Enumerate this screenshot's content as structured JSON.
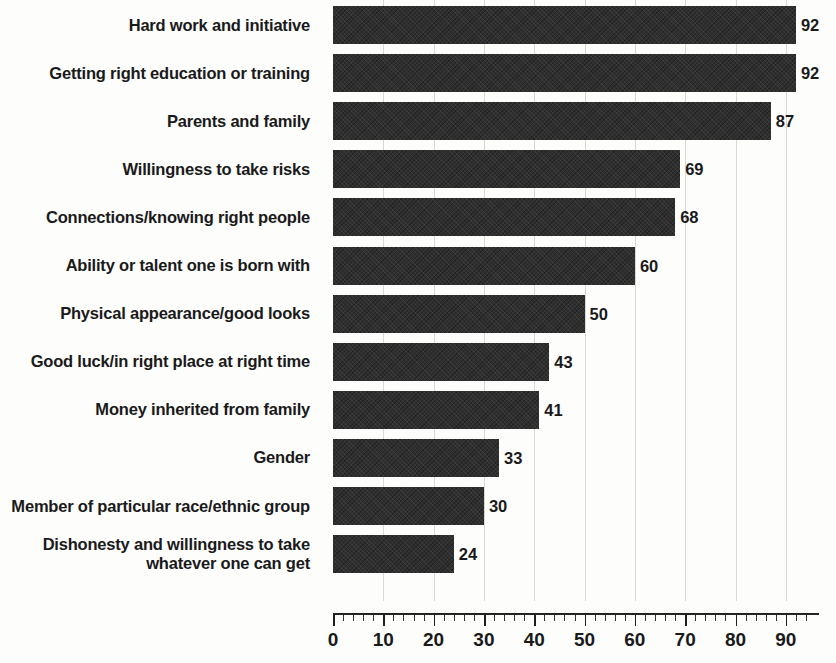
{
  "chart_data": {
    "type": "bar",
    "orientation": "horizontal",
    "title": "",
    "xlabel": "",
    "ylabel": "",
    "xlim": [
      0,
      96
    ],
    "grid": true,
    "legend": false,
    "bar_color": "#2f2f2f",
    "categories": [
      "Hard work and initiative",
      "Getting right education or training",
      "Parents and family",
      "Willingness to take risks",
      "Connections/knowing right people",
      "Ability or talent one is born with",
      "Physical appearance/good looks",
      "Good luck/in right place at right time",
      "Money inherited from family",
      "Gender",
      "Member of particular race/ethnic group",
      "Dishonesty and willingness to take\nwhatever one can get"
    ],
    "values": [
      92,
      92,
      87,
      69,
      68,
      60,
      50,
      43,
      41,
      33,
      30,
      24
    ],
    "value_labels": [
      "92",
      "92",
      "87",
      "69",
      "68",
      "60",
      "50",
      "43",
      "41",
      "33",
      "30",
      "24"
    ],
    "axis": {
      "tick_labels": [
        "0",
        "10",
        "20",
        "30",
        "40",
        "50",
        "60",
        "70",
        "80",
        "90"
      ],
      "tick_values": [
        0,
        10,
        20,
        30,
        40,
        50,
        60,
        70,
        80,
        90
      ],
      "minor_tick_step": 2,
      "major_tick_step": 10
    }
  }
}
